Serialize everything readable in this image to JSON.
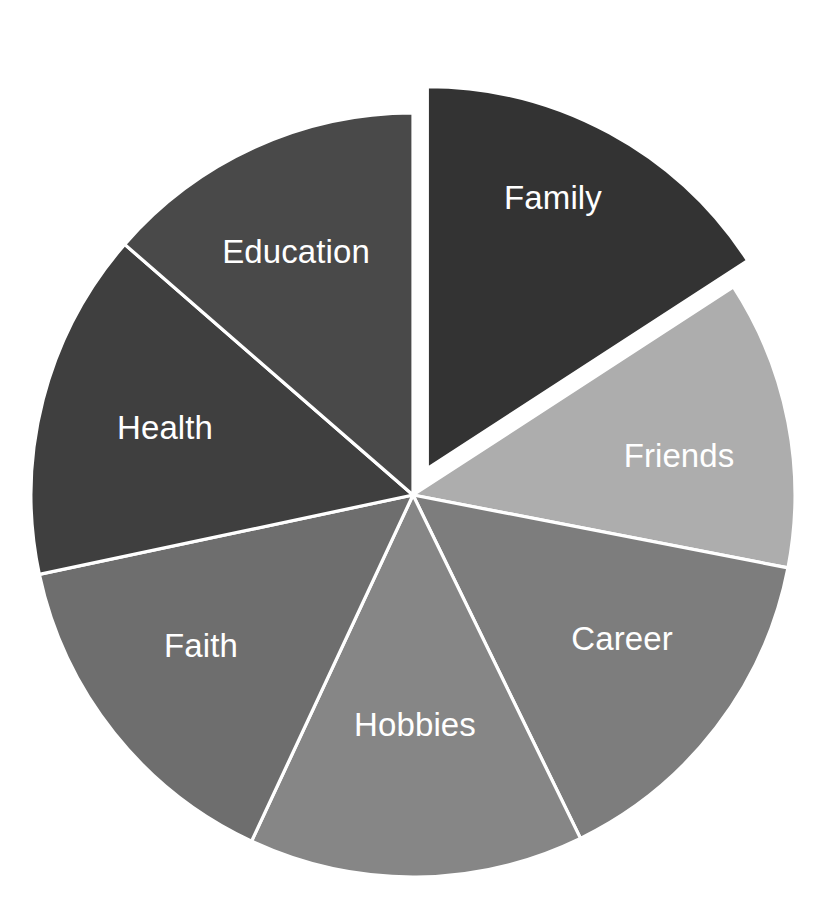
{
  "chart_data": {
    "type": "pie",
    "title": "",
    "subtitle": "",
    "xlabel": "",
    "ylabel": "",
    "legend_position": "none",
    "grid": false,
    "labels_inside_slices": true,
    "label_text_color": "#ffffff",
    "slice_border_color": "#ffffff",
    "background_color": "#ffffff",
    "center": {
      "x": 413,
      "y": 495
    },
    "radius": 382,
    "start_angle_deg": 0,
    "direction": "clockwise",
    "categories": [
      "Family",
      "Friends",
      "Career",
      "Hobbies",
      "Faith",
      "Health",
      "Education"
    ],
    "values": [
      15.8,
      12.2,
      14.7,
      14.2,
      14.7,
      14.7,
      13.6
    ],
    "slices": [
      {
        "label": "Family",
        "value": 15.8,
        "start_angle_deg": 0,
        "end_angle_deg": 57,
        "color": "#333333",
        "exploded": true,
        "explode_offset_px": 30,
        "label_x": 553,
        "label_y": 200
      },
      {
        "label": "Friends",
        "value": 12.2,
        "start_angle_deg": 57,
        "end_angle_deg": 101,
        "color": "#adadad",
        "exploded": false,
        "explode_offset_px": 0,
        "label_x": 679,
        "label_y": 458
      },
      {
        "label": "Career",
        "value": 14.7,
        "start_angle_deg": 101,
        "end_angle_deg": 154,
        "color": "#7d7d7d",
        "exploded": false,
        "explode_offset_px": 0,
        "label_x": 622,
        "label_y": 641
      },
      {
        "label": "Hobbies",
        "value": 14.2,
        "start_angle_deg": 154,
        "end_angle_deg": 205,
        "color": "#868686",
        "exploded": false,
        "explode_offset_px": 0,
        "label_x": 415,
        "label_y": 727
      },
      {
        "label": "Faith",
        "value": 14.7,
        "start_angle_deg": 205,
        "end_angle_deg": 258,
        "color": "#6e6e6e",
        "exploded": false,
        "explode_offset_px": 0,
        "label_x": 201,
        "label_y": 648
      },
      {
        "label": "Health",
        "value": 14.7,
        "start_angle_deg": 258,
        "end_angle_deg": 311,
        "color": "#3f3f3f",
        "exploded": false,
        "explode_offset_px": 0,
        "label_x": 165,
        "label_y": 430
      },
      {
        "label": "Education",
        "value": 13.6,
        "start_angle_deg": 311,
        "end_angle_deg": 360,
        "color": "#494949",
        "exploded": false,
        "explode_offset_px": 0,
        "label_x": 296,
        "label_y": 254
      }
    ]
  }
}
